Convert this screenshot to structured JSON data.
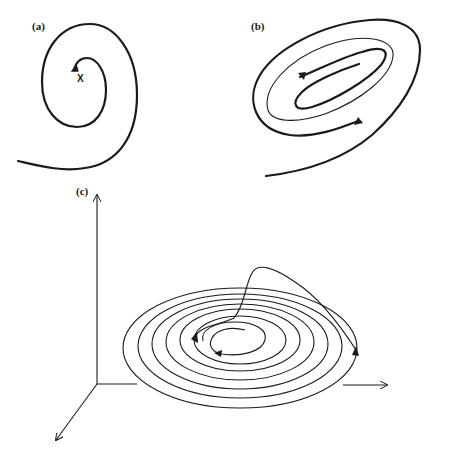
{
  "figure": {
    "panels": [
      {
        "id": "a",
        "label": "(a)",
        "description": "Inward spiral converging to fixed point",
        "marker": "X"
      },
      {
        "id": "b",
        "label": "(b)",
        "description": "Trajectories converging to limit cycle (elliptical)"
      },
      {
        "id": "c",
        "label": "(c)",
        "description": "3D phase space spiral on a plane with escaping trajectory"
      }
    ],
    "colors": {
      "stroke": "#1a1a1a",
      "background": "#ffffff"
    }
  }
}
